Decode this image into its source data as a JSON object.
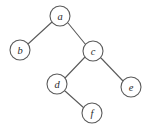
{
  "figure": {
    "kind": "binary-tree-diagram",
    "width": 150,
    "height": 131,
    "background_color": "#ffffff",
    "stroke_color": "#5a5a5a",
    "label_color": "#2b2b2b",
    "node_radius": 10
  },
  "chart_data": {
    "type": "diagram",
    "title": "",
    "nodes": [
      {
        "id": "a",
        "label": "a",
        "x": 60,
        "y": 16
      },
      {
        "id": "b",
        "label": "b",
        "x": 20,
        "y": 50
      },
      {
        "id": "c",
        "label": "c",
        "x": 93,
        "y": 51
      },
      {
        "id": "d",
        "label": "d",
        "x": 57,
        "y": 84
      },
      {
        "id": "e",
        "label": "e",
        "x": 131,
        "y": 87
      },
      {
        "id": "f",
        "label": "f",
        "x": 92,
        "y": 113
      }
    ],
    "edges": [
      {
        "from": "a",
        "to": "b",
        "x1": 52,
        "y1": 22,
        "x2": 28,
        "y2": 44
      },
      {
        "from": "a",
        "to": "c",
        "x1": 68,
        "y1": 23,
        "x2": 86,
        "y2": 45
      },
      {
        "from": "c",
        "to": "d",
        "x1": 85,
        "y1": 57,
        "x2": 65,
        "y2": 78
      },
      {
        "from": "c",
        "to": "e",
        "x1": 101,
        "y1": 58,
        "x2": 123,
        "y2": 81
      },
      {
        "from": "d",
        "to": "f",
        "x1": 65,
        "y1": 91,
        "x2": 84,
        "y2": 108
      }
    ]
  }
}
